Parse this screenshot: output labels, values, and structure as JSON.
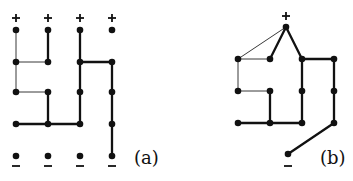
{
  "figure": {
    "panels": [
      {
        "id": "a",
        "label": "(a)",
        "label_pos": [
          134,
          147
        ],
        "plus_markers": [
          [
            16,
            18
          ],
          [
            48,
            18
          ],
          [
            80,
            18
          ],
          [
            112,
            18
          ]
        ],
        "minus_markers": [
          [
            16,
            166
          ],
          [
            48,
            166
          ],
          [
            80,
            166
          ],
          [
            112,
            166
          ]
        ],
        "nodes": [
          [
            16,
            30
          ],
          [
            48,
            30
          ],
          [
            80,
            30
          ],
          [
            112,
            30
          ],
          [
            16,
            62
          ],
          [
            48,
            62
          ],
          [
            80,
            62
          ],
          [
            112,
            62
          ],
          [
            16,
            92
          ],
          [
            48,
            92
          ],
          [
            80,
            92
          ],
          [
            112,
            92
          ],
          [
            16,
            124
          ],
          [
            48,
            124
          ],
          [
            80,
            124
          ],
          [
            112,
            124
          ],
          [
            16,
            156
          ],
          [
            48,
            156
          ],
          [
            80,
            156
          ],
          [
            112,
            156
          ]
        ],
        "thin_edges": [
          [
            [
              16,
              30
            ],
            [
              16,
              62
            ]
          ],
          [
            [
              16,
              62
            ],
            [
              48,
              62
            ]
          ],
          [
            [
              16,
              62
            ],
            [
              16,
              92
            ]
          ],
          [
            [
              16,
              92
            ],
            [
              48,
              92
            ]
          ]
        ],
        "thick_edges": [
          [
            [
              48,
              30
            ],
            [
              48,
              62
            ]
          ],
          [
            [
              80,
              30
            ],
            [
              80,
              124
            ]
          ],
          [
            [
              80,
              62
            ],
            [
              112,
              62
            ]
          ],
          [
            [
              112,
              62
            ],
            [
              112,
              156
            ]
          ],
          [
            [
              48,
              92
            ],
            [
              48,
              124
            ]
          ],
          [
            [
              16,
              124
            ],
            [
              80,
              124
            ]
          ]
        ]
      },
      {
        "id": "b",
        "label": "(b)",
        "label_pos": [
          320,
          147
        ],
        "plus_markers": [
          [
            286,
            16
          ]
        ],
        "minus_markers": [
          [
            288,
            166
          ]
        ],
        "nodes": [
          [
            286,
            27
          ],
          [
            238,
            59
          ],
          [
            270,
            59
          ],
          [
            302,
            59
          ],
          [
            334,
            59
          ],
          [
            238,
            91
          ],
          [
            270,
            91
          ],
          [
            302,
            91
          ],
          [
            334,
            91
          ],
          [
            238,
            123
          ],
          [
            270,
            123
          ],
          [
            302,
            123
          ],
          [
            334,
            123
          ],
          [
            288,
            154
          ]
        ],
        "thin_edges": [
          [
            [
              286,
              27
            ],
            [
              238,
              59
            ]
          ],
          [
            [
              238,
              59
            ],
            [
              270,
              59
            ]
          ],
          [
            [
              238,
              59
            ],
            [
              238,
              91
            ]
          ],
          [
            [
              238,
              91
            ],
            [
              270,
              91
            ]
          ]
        ],
        "thick_edges": [
          [
            [
              286,
              27
            ],
            [
              270,
              59
            ]
          ],
          [
            [
              286,
              27
            ],
            [
              302,
              59
            ]
          ],
          [
            [
              302,
              59
            ],
            [
              302,
              123
            ]
          ],
          [
            [
              302,
              59
            ],
            [
              334,
              59
            ]
          ],
          [
            [
              334,
              59
            ],
            [
              334,
              123
            ]
          ],
          [
            [
              270,
              91
            ],
            [
              270,
              123
            ]
          ],
          [
            [
              238,
              123
            ],
            [
              302,
              123
            ]
          ],
          [
            [
              334,
              123
            ],
            [
              288,
              154
            ]
          ]
        ]
      }
    ]
  }
}
